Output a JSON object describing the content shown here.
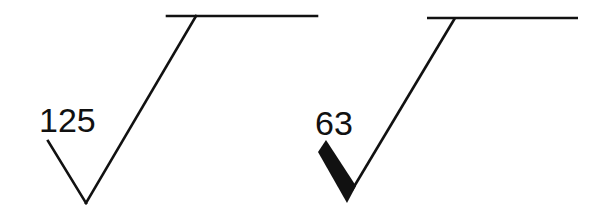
{
  "diagram": {
    "type": "surface-roughness-symbols",
    "stroke_color": "#111111",
    "background": "#ffffff",
    "symbols": [
      {
        "label": "125",
        "style": "standard check mark with extension line"
      },
      {
        "label": "63",
        "style": "check mark with thick (bold) short leg and extension line"
      }
    ]
  }
}
